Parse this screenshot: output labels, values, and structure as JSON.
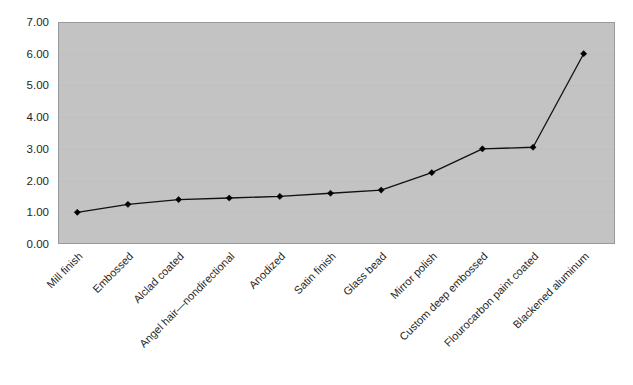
{
  "chart_data": {
    "type": "line",
    "title": "",
    "subtitle": "",
    "xlabel": "",
    "ylabel": "",
    "categories": [
      "Mill finish",
      "Embossed",
      "Alclad coated",
      "Angel hair—nondirectional",
      "Anodized",
      "Satin finish",
      "Glass bead",
      "Mirror polish",
      "Custom deep embossed",
      "Flourocarbon paint coated",
      "Blackened aluminum"
    ],
    "values": [
      1.0,
      1.25,
      1.4,
      1.45,
      1.5,
      1.6,
      1.7,
      2.25,
      3.0,
      3.05,
      6.0
    ],
    "series": [
      {
        "name": "",
        "values": [
          1.0,
          1.25,
          1.4,
          1.45,
          1.5,
          1.6,
          1.7,
          2.25,
          3.0,
          3.05,
          6.0
        ]
      }
    ],
    "ylim": [
      0,
      7
    ],
    "ytick_step": 1,
    "ytick_labels": [
      "0.00",
      "1.00",
      "2.00",
      "3.00",
      "4.00",
      "5.00",
      "6.00",
      "7.00"
    ],
    "grid": true,
    "legend": false,
    "legend_position": "none",
    "marker": "diamond",
    "xtick_rotation": -45,
    "colors": {
      "plot_background": "#c3c3c3",
      "page_background": "#ffffff",
      "line": "#111111",
      "marker": "#000000",
      "gridline": "#bcbcbc",
      "border": "#9a9a9a",
      "text": "#1f1f1f"
    }
  }
}
